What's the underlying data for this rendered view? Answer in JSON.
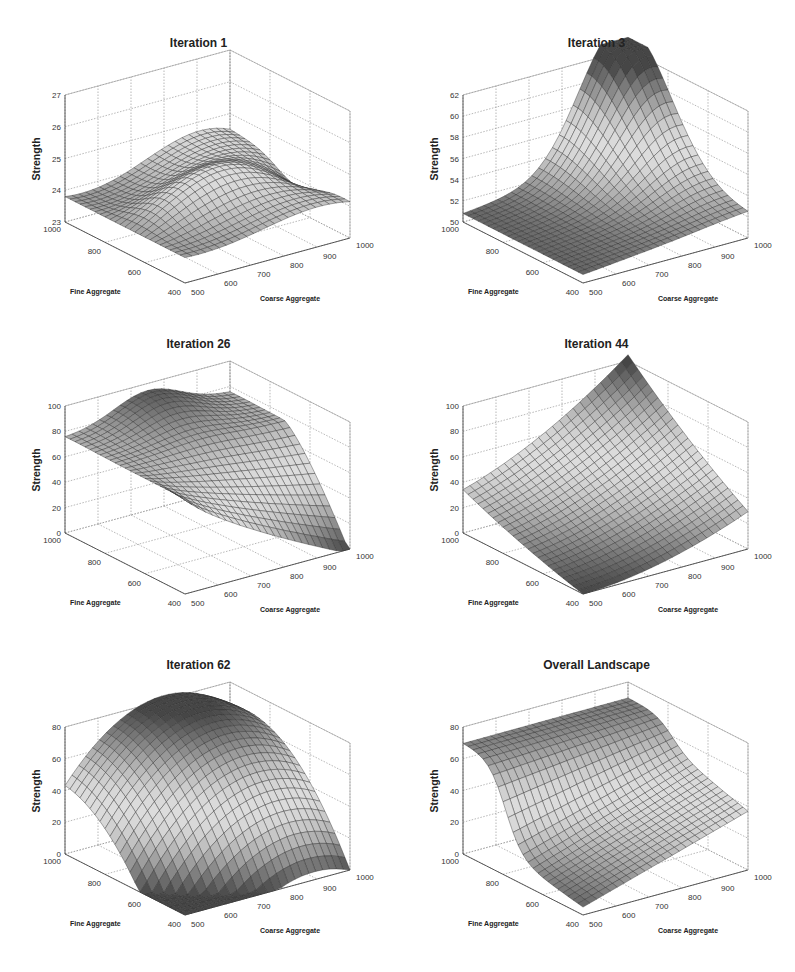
{
  "figure": {
    "panels": [
      {
        "title": "Iteration 1",
        "zlabel": "Strength",
        "xlabel": "Fine Aggregate",
        "ylabel": "Coarse Aggregate"
      },
      {
        "title": "Iteration 3",
        "zlabel": "Strength",
        "xlabel": "Fine Aggregate",
        "ylabel": "Coarse Aggregate"
      },
      {
        "title": "Iteration 26",
        "zlabel": "Strength",
        "xlabel": "Fine Aggregate",
        "ylabel": "Coarse Aggregate"
      },
      {
        "title": "Iteration 44",
        "zlabel": "Strength",
        "xlabel": "Fine Aggregate",
        "ylabel": "Coarse Aggregate"
      },
      {
        "title": "Iteration 62",
        "zlabel": "Strength",
        "xlabel": "Fine Aggregate",
        "ylabel": "Coarse Aggregate"
      },
      {
        "title": "Overall Landscape",
        "zlabel": "Strength",
        "xlabel": "Fine Aggregate",
        "ylabel": "Coarse Aggregate"
      }
    ]
  },
  "chart_data": [
    {
      "type": "surface3d",
      "title": "Iteration 1",
      "xlabel": "Fine Aggregate",
      "ylabel": "Coarse Aggregate",
      "zlabel": "Strength",
      "xlim": [
        400,
        1000
      ],
      "ylim": [
        500,
        1000
      ],
      "zlim": [
        23,
        27
      ],
      "xticks": [
        400,
        600,
        800,
        1000
      ],
      "yticks": [
        500,
        600,
        700,
        800,
        900,
        1000
      ],
      "zticks": [
        23,
        24,
        25,
        26,
        27
      ],
      "shape": "wave",
      "z_min": 23.6,
      "z_max": 25.9,
      "description": "Low-amplitude saddle/wave surface, ~23.8 at fine=1000/coarse=500, peaks ~25.3 near center and ~25.8 at high coarse aggregate"
    },
    {
      "type": "surface3d",
      "title": "Iteration 3",
      "xlabel": "Fine Aggregate",
      "ylabel": "Coarse Aggregate",
      "zlabel": "Strength",
      "xlim": [
        400,
        1000
      ],
      "ylim": [
        500,
        1000
      ],
      "zlim": [
        50,
        62
      ],
      "xticks": [
        400,
        600,
        800,
        1000
      ],
      "yticks": [
        500,
        600,
        700,
        800,
        900,
        1000
      ],
      "zticks": [
        50,
        52,
        54,
        56,
        58,
        60,
        62
      ],
      "shape": "peak",
      "z_min": 50.5,
      "z_max": 63.5,
      "description": "Single peak rising to ~63 at fine=1000, coarse=1000 (back corner), ~51 elsewhere"
    },
    {
      "type": "surface3d",
      "title": "Iteration 26",
      "xlabel": "Fine Aggregate",
      "ylabel": "Coarse Aggregate",
      "zlabel": "Strength",
      "xlim": [
        400,
        1000
      ],
      "ylim": [
        500,
        1000
      ],
      "zlim": [
        0,
        100
      ],
      "xticks": [
        400,
        600,
        800,
        1000
      ],
      "yticks": [
        500,
        600,
        700,
        800,
        900,
        1000
      ],
      "zticks": [
        0,
        20,
        40,
        60,
        80,
        100
      ],
      "shape": "ridge-drop",
      "z_min": 0,
      "z_max": 95,
      "description": "Plateau ~75 at fine=1000, peak ~95 at back, falling to ~0 at fine=400/coarse=1000"
    },
    {
      "type": "surface3d",
      "title": "Iteration 44",
      "xlabel": "Fine Aggregate",
      "ylabel": "Coarse Aggregate",
      "zlabel": "Strength",
      "xlim": [
        400,
        1000
      ],
      "ylim": [
        500,
        1000
      ],
      "zlim": [
        0,
        100
      ],
      "xticks": [
        400,
        600,
        800,
        1000
      ],
      "yticks": [
        500,
        600,
        700,
        800,
        900,
        1000
      ],
      "zticks": [
        0,
        20,
        40,
        60,
        80,
        100
      ],
      "shape": "rising",
      "z_min": 0,
      "z_max": 105,
      "description": "Near 0 at fine=400/coarse=500, rising steadily to ~105 at coarse=1000, fine=1000"
    },
    {
      "type": "surface3d",
      "title": "Iteration 62",
      "xlabel": "Fine Aggregate",
      "ylabel": "Coarse Aggregate",
      "zlabel": "Strength",
      "xlim": [
        400,
        1000
      ],
      "ylim": [
        500,
        1000
      ],
      "zlim": [
        0,
        80
      ],
      "xticks": [
        400,
        600,
        800,
        1000
      ],
      "yticks": [
        500,
        600,
        700,
        800,
        900,
        1000
      ],
      "zticks": [
        0,
        20,
        40,
        60,
        80
      ],
      "shape": "dome",
      "z_min": 0,
      "z_max": 85,
      "description": "Dome surface, ~0 at fine=400/coarse=500, ~30 at corners, peaking ~85 at back corner"
    },
    {
      "type": "surface3d",
      "title": "Overall Landscape",
      "xlabel": "Fine Aggregate",
      "ylabel": "Coarse Aggregate",
      "zlabel": "Strength",
      "xlim": [
        400,
        1000
      ],
      "ylim": [
        500,
        1000
      ],
      "zlim": [
        0,
        80
      ],
      "xticks": [
        400,
        600,
        800,
        1000
      ],
      "yticks": [
        500,
        600,
        700,
        800,
        900,
        1000
      ],
      "zticks": [
        0,
        20,
        40,
        60,
        80
      ],
      "shape": "plateau-valley",
      "z_min": 5,
      "z_max": 75,
      "description": "High plateau ~70 along fine=1000 edge, steep drop to ~40 then down to ~5 at fine=400/coarse=500"
    }
  ]
}
